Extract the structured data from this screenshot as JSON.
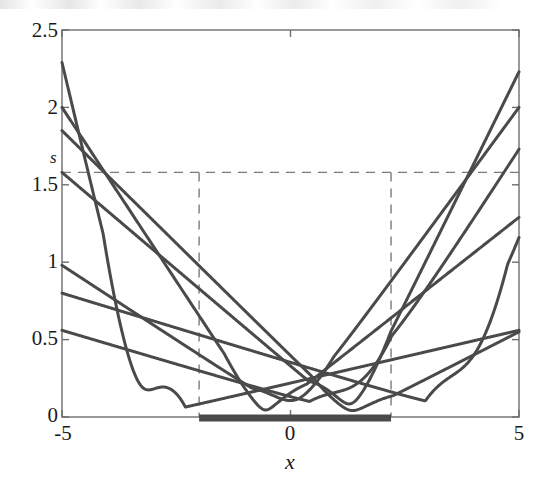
{
  "chart_data": {
    "type": "line",
    "title": "",
    "xlabel": "x",
    "ylabel": "",
    "xlim": [
      -5,
      5
    ],
    "ylim": [
      0,
      2.5
    ],
    "grid": false,
    "legend": null,
    "x_ticks": [
      -5,
      0,
      5
    ],
    "x_tick_labels": [
      "-5",
      "0",
      "5"
    ],
    "y_ticks": [
      0,
      0.5,
      1,
      1.5,
      2,
      2.5
    ],
    "y_tick_labels": [
      "0",
      "0.5",
      "1",
      "1.5",
      "2",
      "2.5"
    ],
    "annotations": [
      {
        "name": "s-level-label",
        "text": "s",
        "x": -5.0,
        "y": 1.62,
        "italic": true
      }
    ],
    "threshold_line": {
      "name": "s-threshold",
      "orientation": "horizontal",
      "value": 1.58,
      "style": "dashed",
      "label": "s"
    },
    "vertical_markers": [
      {
        "name": "left-bound",
        "x": -2.0,
        "style": "dashed",
        "y_top": 1.58
      },
      {
        "name": "right-bound",
        "x": 2.2,
        "style": "dashed",
        "y_top": 1.58
      }
    ],
    "highlight_segment": {
      "name": "x-axis-support-interval",
      "y": 0,
      "x_start": -2.0,
      "x_end": 2.2,
      "style": "thick-solid"
    },
    "series": [
      {
        "name": "curve-1",
        "cusp_x": -3.2,
        "left_value": 2.29,
        "right_value": 0.56,
        "slope": -0.272,
        "smooth": 0.075,
        "comment": "steep descending from upper-left, cusp at x=-3.2, rises gently to right"
      },
      {
        "name": "curve-2",
        "cusp_x": -0.55,
        "left_value": 2.0,
        "right_value": 1.29,
        "slope": -0.449,
        "smooth": 0.06
      },
      {
        "name": "curve-3",
        "cusp_x": 1.35,
        "left_value": 1.85,
        "right_value": 0.55,
        "slope": -0.292,
        "smooth": 0.055
      },
      {
        "name": "curve-4",
        "cusp_x": 1.3,
        "left_value": 1.58,
        "right_value": 2.23,
        "slope": -0.251,
        "smooth": 0.05
      },
      {
        "name": "curve-5",
        "cusp_x": 0.05,
        "left_value": 0.98,
        "right_value": 2.0,
        "slope": -0.195,
        "smooth": 0.07
      },
      {
        "name": "curve-6",
        "cusp_x": 3.85,
        "left_value": 0.8,
        "right_value": 1.16,
        "slope": -0.09,
        "smooth": 0.065
      },
      {
        "name": "curve-7",
        "cusp_x": 1.32,
        "left_value": 0.56,
        "right_value": 1.73,
        "slope": -0.086,
        "smooth": 0.06
      }
    ],
    "cusp_positions": [
      -3.2,
      -0.55,
      0.05,
      1.3,
      1.32,
      1.35,
      3.85
    ],
    "n_curves": 7
  },
  "style": {
    "curve_color": "#4a4a4a",
    "axis_color": "#6e6e6e",
    "dash_color": "#7a7a7a",
    "bold_segment_color": "#4a4a4a",
    "background": "#ffffff",
    "curve_width": 3.0,
    "axis_width": 1.4,
    "dash_width": 1.4,
    "bold_segment_width": 7
  },
  "labels": {
    "y_25": "2.5",
    "y_2": "2",
    "y_15": "1.5",
    "y_1": "1",
    "y_05": "0.5",
    "y_0": "0",
    "x_neg5": "-5",
    "x_0": "0",
    "x_5": "5",
    "s_label": "s",
    "x_axis_title": "x"
  }
}
